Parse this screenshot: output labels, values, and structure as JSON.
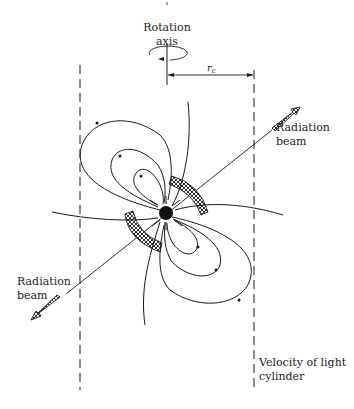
{
  "figure": {
    "type": "pulsar magnetosphere diagram",
    "labels": {
      "rotation_axis_line1": "Rotation",
      "rotation_axis_line2": "axis",
      "rc_main": "r",
      "rc_sub": "c",
      "beam_right_line1": "Radiation",
      "beam_right_line2": "beam",
      "beam_left_line1": "Radiation",
      "beam_left_line2": "beam",
      "light_cylinder_line1": "Velocity of light",
      "light_cylinder_line2": "cylinder"
    },
    "colors": {
      "ink": "#1a1a1a",
      "background": "#ffffff"
    },
    "elements": [
      "rotation-axis",
      "rotation-direction-arrow",
      "light-cylinder-radius-rc",
      "light-cylinder-left-dashed",
      "light-cylinder-right-dashed",
      "neutron-star",
      "magnetic-field-lines",
      "hatched-emission-regions",
      "radiation-beam-axis",
      "radiation-beam-arrows"
    ]
  }
}
